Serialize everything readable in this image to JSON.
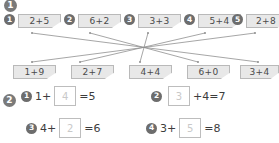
{
  "page": {
    "background": "#ffffff",
    "card_fill": "#e8e8e8",
    "card_border": "#b9b9b9",
    "marker_fill": "#6d6d6d",
    "line_color": "#8f8f8f"
  },
  "section1": {
    "marker": "1",
    "top_row": [
      {
        "marker": "1",
        "expr": "2+5"
      },
      {
        "marker": "2",
        "expr": "6+2"
      },
      {
        "marker": "3",
        "expr": "3+3"
      },
      {
        "marker": "4",
        "expr": "5+4"
      },
      {
        "marker": "5",
        "expr": "2+8"
      }
    ],
    "bottom_row": [
      {
        "expr": "1+9"
      },
      {
        "expr": "2+7"
      },
      {
        "expr": "4+4"
      },
      {
        "expr": "6+0"
      },
      {
        "expr": "3+4"
      }
    ],
    "connections": [
      {
        "from": 0,
        "to": 4
      },
      {
        "from": 1,
        "to": 3
      },
      {
        "from": 2,
        "to": 2
      },
      {
        "from": 3,
        "to": 1
      },
      {
        "from": 4,
        "to": 0
      }
    ]
  },
  "section2": {
    "marker": "2",
    "problems": [
      {
        "marker": "1",
        "left": "1+",
        "answer": "4",
        "right": "=5"
      },
      {
        "marker": "2",
        "left": "",
        "answer": "3",
        "right": "+4=7"
      },
      {
        "marker": "3",
        "left": "4+",
        "answer": "2",
        "right": "=6"
      },
      {
        "marker": "4",
        "left": "3+",
        "answer": "5",
        "right": "=8"
      }
    ]
  }
}
